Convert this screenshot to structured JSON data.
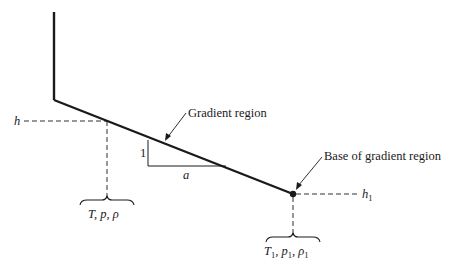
{
  "diagram": {
    "type": "temperature-altitude profile (gradient region)",
    "colors": {
      "ink": "#1a1a1a",
      "background": "#ffffff"
    },
    "labels": {
      "h": "h",
      "h1_base": "h",
      "h1_sub": "1",
      "gradient_region": "Gradient region",
      "base_of_gradient_region": "Base of gradient region",
      "slope_rise": "1",
      "slope_run": "a",
      "state_at_h": "T, p, ρ",
      "state_at_h1_T": "T",
      "state_at_h1_p": "p",
      "state_at_h1_rho": "ρ",
      "sub1": "1",
      "comma": ", "
    }
  }
}
